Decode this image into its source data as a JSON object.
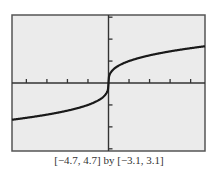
{
  "chart_data": {
    "type": "line",
    "title": "",
    "function": "y = x^(1/3)",
    "xlabel": "",
    "ylabel": "",
    "xlim": [
      -4.7,
      4.7
    ],
    "ylim": [
      -3.1,
      3.1
    ],
    "x_ticks": [
      -4,
      -3,
      -2,
      -1,
      1,
      2,
      3,
      4
    ],
    "y_ticks": [
      -3,
      -2,
      -1,
      1,
      2,
      3
    ],
    "grid": false,
    "legend": null,
    "series": [
      {
        "name": "cube root",
        "x": [
          -4.7,
          -4,
          -3,
          -2,
          -1,
          -0.5,
          -0.1,
          -0.01,
          0,
          0.01,
          0.1,
          0.5,
          1,
          2,
          3,
          4,
          4.7
        ],
        "y": [
          -1.675,
          -1.587,
          -1.442,
          -1.26,
          -1.0,
          -0.794,
          -0.464,
          -0.215,
          0,
          0.215,
          0.464,
          0.794,
          1.0,
          1.26,
          1.442,
          1.587,
          1.675
        ]
      }
    ],
    "caption": "[−4.7, 4.7] by [−3.1, 3.1]"
  },
  "colors": {
    "plot_background": "#ebebeb",
    "frame": "#555555",
    "axes": "#333333",
    "curve": "#1a1a1a"
  }
}
